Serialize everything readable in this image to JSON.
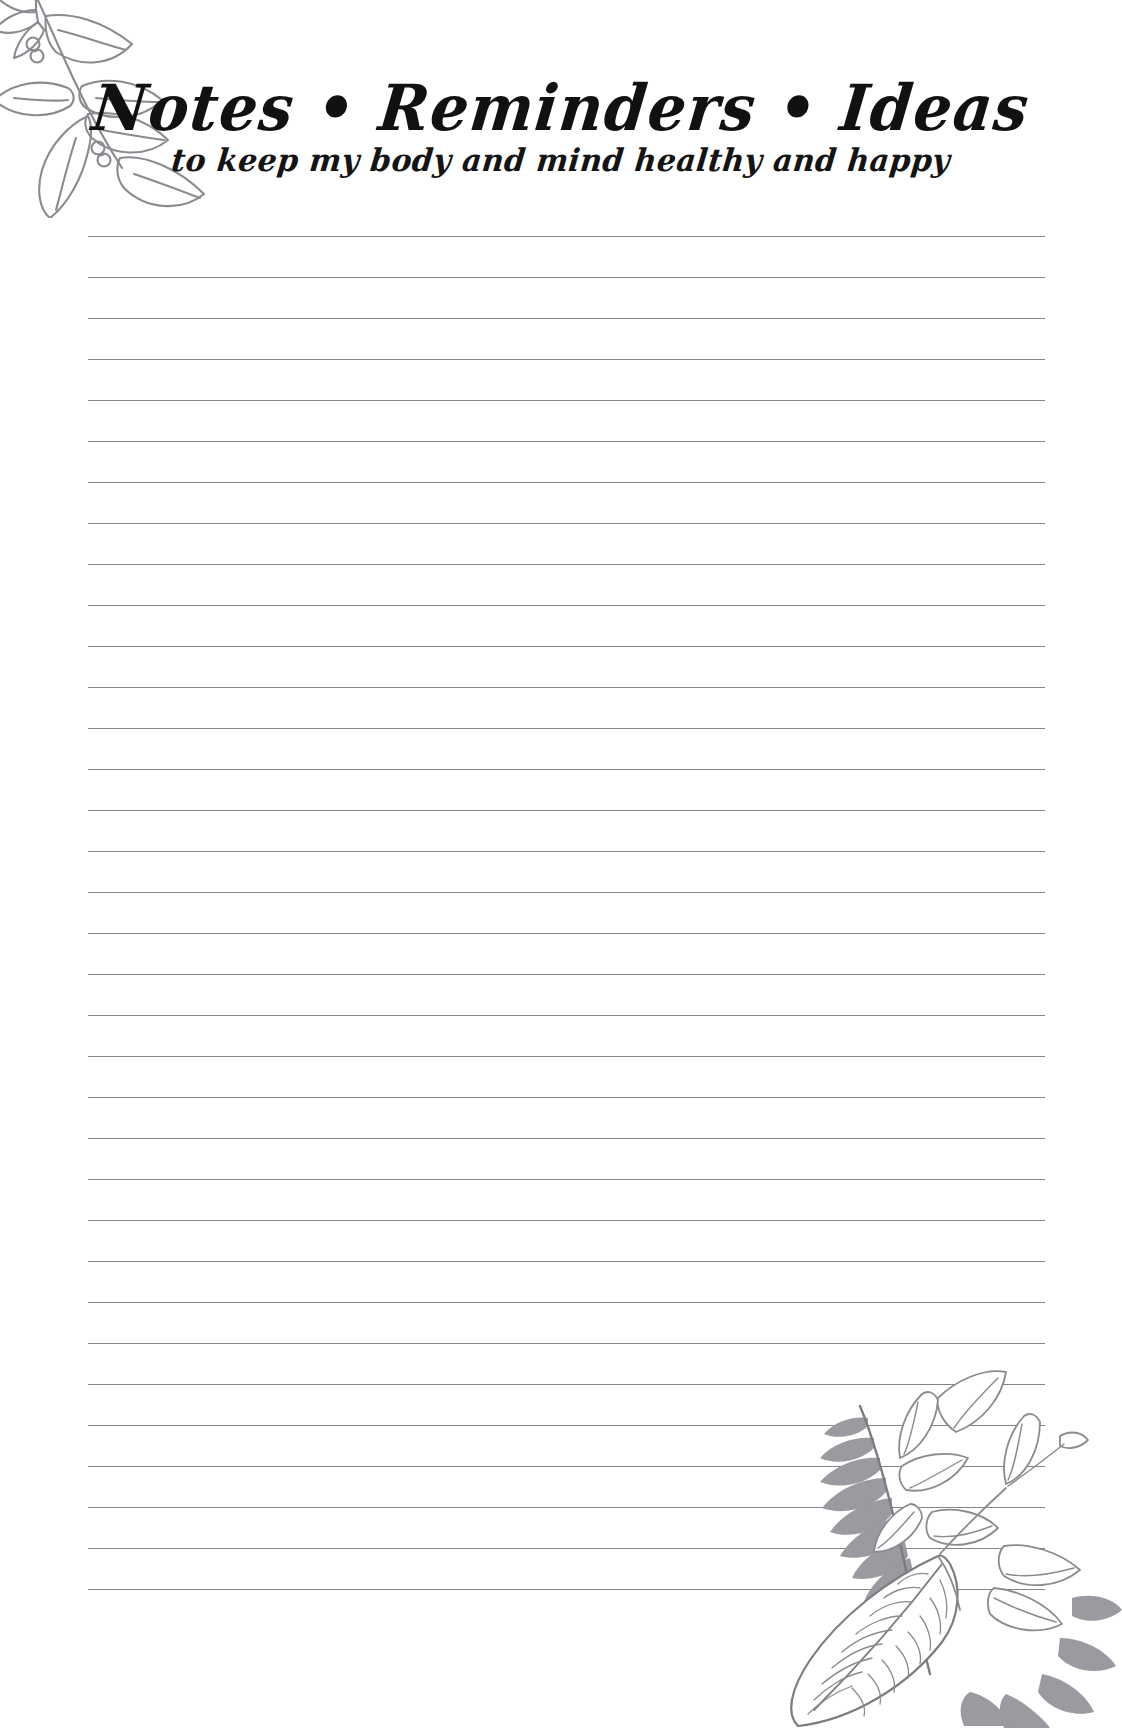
{
  "page": {
    "kind": "printable-notes-page",
    "background_color": "#ffffff",
    "width": 1122,
    "height": 1728
  },
  "header": {
    "title": "Notes • Reminders • Ideas",
    "title_color": "#111111",
    "subtitle": "to keep my body and mind healthy and happy",
    "subtitle_color": "#141414",
    "separator_glyph": "•"
  },
  "writing_area": {
    "line_count": 34,
    "first_line_y": 236,
    "line_spacing": 41,
    "line_left": 88,
    "line_right": 1045,
    "line_color": "#6d6d73"
  },
  "decorations": {
    "top_left": {
      "name": "leaf-branch-top-left",
      "description": "hand-drawn grey botanical branch with pointed leaves and small berry loops",
      "stroke_color": "#8a8a90"
    },
    "bottom_right": {
      "name": "botanical-cluster-bottom-right",
      "description": "fern fronds, outlined leaves with center veins, small bud and a large hatched leaf",
      "stroke_color": "#8a8a90",
      "fill_color": "#9a9aa0"
    }
  }
}
